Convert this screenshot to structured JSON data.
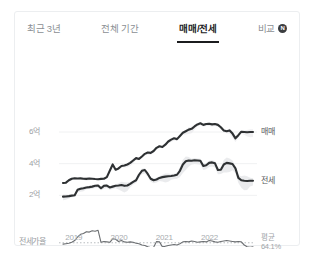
{
  "card": {
    "tabs": [
      {
        "label": "최근 3년",
        "active": false,
        "badge": null
      },
      {
        "label": "전체 기간",
        "active": false,
        "badge": null
      },
      {
        "label": "매매/전세",
        "active": true,
        "badge": null
      },
      {
        "label": "비교",
        "active": false,
        "badge": "N"
      }
    ]
  },
  "chart_data": {
    "type": "line",
    "title": "",
    "xlabel": "",
    "ylabel": "",
    "grid": true,
    "legend_position": "right",
    "ytick_labels": [
      "6억",
      "4억",
      "2억"
    ],
    "ytick_values": [
      6,
      4,
      2
    ],
    "ylim": [
      1.2,
      7.2
    ],
    "xtick_labels": [
      "2019",
      "2020",
      "2021",
      "2022"
    ],
    "x_start": 2018.75,
    "x_end": 2022.95,
    "unit": "억",
    "series": [
      {
        "name": "매매",
        "label": "매매",
        "color": "#2e3133",
        "values": [
          2.78,
          2.8,
          2.95,
          3.05,
          3.08,
          3.06,
          3.07,
          3.05,
          3.04,
          3.06,
          3.05,
          3.03,
          3.02,
          3.04,
          3.05,
          3.15,
          3.55,
          3.95,
          3.62,
          3.7,
          3.85,
          3.88,
          3.95,
          4.05,
          4.2,
          4.35,
          4.3,
          4.45,
          4.62,
          4.7,
          4.68,
          4.8,
          5.0,
          5.1,
          5.05,
          5.2,
          5.4,
          5.52,
          5.6,
          5.55,
          5.75,
          5.95,
          6.05,
          6.15,
          6.2,
          6.35,
          6.48,
          6.55,
          6.45,
          6.5,
          6.52,
          6.48,
          6.5,
          6.45,
          6.3,
          6.1,
          6.05,
          6.1,
          5.9,
          5.6,
          5.8,
          6.02,
          6.0,
          5.98,
          6.0,
          6.0
        ]
      },
      {
        "name": "전세",
        "label": "전세",
        "color": "#2e3133",
        "values": [
          1.92,
          1.93,
          1.95,
          1.98,
          2.0,
          2.35,
          2.42,
          2.45,
          2.5,
          2.52,
          2.55,
          2.6,
          2.62,
          2.45,
          2.6,
          2.62,
          2.5,
          2.55,
          2.6,
          2.62,
          2.65,
          2.6,
          2.62,
          2.72,
          2.85,
          2.95,
          3.3,
          3.55,
          3.6,
          3.35,
          3.05,
          2.95,
          3.0,
          3.1,
          3.15,
          3.18,
          3.2,
          3.22,
          3.25,
          3.3,
          3.55,
          3.95,
          4.15,
          4.2,
          4.18,
          4.22,
          4.2,
          4.18,
          3.85,
          3.9,
          4.05,
          4.08,
          4.02,
          3.6,
          3.62,
          3.95,
          4.05,
          4.02,
          3.98,
          3.7,
          3.1,
          2.95,
          2.92,
          2.9,
          2.92,
          2.92
        ]
      }
    ],
    "band_label": "시세 범위",
    "ratio_series": {
      "name": "전세가율",
      "label": "전세가율",
      "color": "#6b6e71",
      "average_label": "평균",
      "average_value": "64.1%",
      "average_numeric": 64.1,
      "values": [
        63.8,
        63.9,
        64.0,
        64.2,
        64.6,
        65.4,
        66.0,
        66.2,
        66.6,
        66.5,
        66.8,
        66.7,
        66.9,
        64.2,
        64.4,
        64.3,
        64.2,
        65.0,
        64.9,
        64.4,
        64.6,
        64.3,
        64.2,
        64.3,
        64.2,
        64.0,
        63.9,
        63.6,
        63.5,
        63.2,
        63.0,
        63.1,
        64.4,
        64.3,
        63.2,
        63.3,
        63.5,
        63.6,
        63.7,
        63.6,
        63.9,
        64.3,
        64.4,
        64.3,
        64.5,
        64.4,
        64.2,
        64.3,
        64.4,
        64.3,
        64.6,
        64.5,
        64.3,
        64.2,
        64.4,
        64.5,
        64.6,
        64.5,
        64.4,
        64.3,
        64.4,
        64.3,
        63.6,
        63.2,
        63.1,
        63.2
      ]
    }
  }
}
